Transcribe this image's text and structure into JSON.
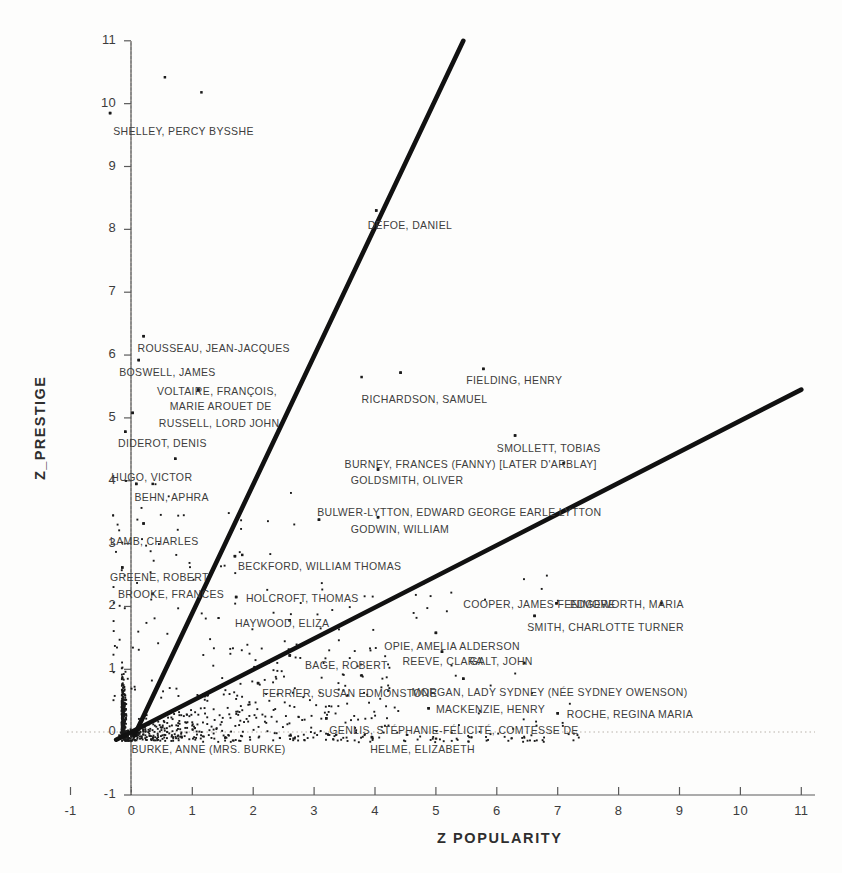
{
  "chart_data": {
    "type": "scatter",
    "title": "",
    "xlabel": "Z  POPULARITY",
    "ylabel": "Z_PRESTIGE",
    "xlim": [
      -1,
      11
    ],
    "ylim": [
      -1,
      11
    ],
    "xticks": [
      "-1",
      "0",
      "1",
      "2",
      "3",
      "4",
      "5",
      "6",
      "7",
      "8",
      "9",
      "10",
      "11"
    ],
    "yticks": [
      "-1",
      "0",
      "1",
      "2",
      "3",
      "4",
      "5",
      "6",
      "7",
      "8",
      "9",
      "10",
      "11"
    ],
    "grid": false,
    "reference_lines": [
      {
        "name": "zero-vertical",
        "orientation": "vertical",
        "value": 0,
        "style": "dotted"
      },
      {
        "name": "zero-horizontal",
        "orientation": "horizontal",
        "value": 0,
        "style": "dotted"
      }
    ],
    "trend_lines": [
      {
        "name": "steep-regression-line",
        "x0": 0.05,
        "y0": -0.05,
        "x1": 5.45,
        "y1": 11.0,
        "style": "solid-thick"
      },
      {
        "name": "shallow-regression-line",
        "x0": -0.25,
        "y0": -0.12,
        "x1": 11.0,
        "y1": 5.45,
        "style": "solid-thick"
      }
    ],
    "legend": null,
    "annotations": [
      {
        "label": "SHELLEY, PERCY BYSSHE",
        "x": -0.3,
        "y": 9.55,
        "point_x": -0.35,
        "point_y": 9.85
      },
      {
        "label": "ROUSSEAU, JEAN-JACQUES",
        "x": 0.1,
        "y": 6.1,
        "point_x": 0.2,
        "point_y": 6.3
      },
      {
        "label": "BOSWELL, JAMES",
        "x": -0.2,
        "y": 5.72,
        "point_x": 0.12,
        "point_y": 5.92
      },
      {
        "label": "VOLTAIRE, FRANÇOIS,",
        "x": 0.42,
        "y": 5.42,
        "point_x": 1.1,
        "point_y": 5.45
      },
      {
        "label": "MARIE AROUET DE",
        "x": 0.63,
        "y": 5.17,
        "point_x": null,
        "point_y": null
      },
      {
        "label": "RUSSELL, LORD JOHN",
        "x": 0.45,
        "y": 4.9,
        "point_x": 0.02,
        "point_y": 5.08
      },
      {
        "label": "DIDEROT, DENIS",
        "x": -0.22,
        "y": 4.58,
        "point_x": -0.1,
        "point_y": 4.78
      },
      {
        "label": "HUGO, VICTOR",
        "x": -0.33,
        "y": 4.05,
        "point_x": 0.72,
        "point_y": 4.35
      },
      {
        "label": "BEHN, APHRA",
        "x": 0.05,
        "y": 3.72,
        "point_x": 0.08,
        "point_y": 3.95
      },
      {
        "label": "LAMB, CHARLES",
        "x": -0.35,
        "y": 3.02,
        "point_x": 0.2,
        "point_y": 3.32
      },
      {
        "label": "GREENE, ROBERT",
        "x": -0.35,
        "y": 2.45,
        "point_x": -0.15,
        "point_y": 2.62
      },
      {
        "label": "BROOKE, FRANCES",
        "x": -0.22,
        "y": 2.18,
        "point_x": 0.35,
        "point_y": 2.2
      },
      {
        "label": "DEFOE, DANIEL",
        "x": 3.88,
        "y": 8.05,
        "point_x": 4.02,
        "point_y": 8.3
      },
      {
        "label": "FIELDING, HENRY",
        "x": 5.5,
        "y": 5.58,
        "point_x": 5.78,
        "point_y": 5.78
      },
      {
        "label": "RICHARDSON, SAMUEL",
        "x": 3.78,
        "y": 5.28,
        "point_x": 4.42,
        "point_y": 5.72
      },
      {
        "label": "SMOLLETT, TOBIAS",
        "x": 6.0,
        "y": 4.5,
        "point_x": 6.3,
        "point_y": 4.72
      },
      {
        "label": "BURNEY, FRANCES (FANNY) [LATER D'ARBLAY]",
        "x": 3.5,
        "y": 4.25,
        "point_x": 7.1,
        "point_y": 4.28
      },
      {
        "label": "GOLDSMITH, OLIVER",
        "x": 3.6,
        "y": 4.0,
        "point_x": 4.05,
        "point_y": 4.18
      },
      {
        "label": "BULWER-LYTTON, EDWARD GEORGE EARLE LYTTON",
        "x": 3.05,
        "y": 3.48,
        "point_x": 3.08,
        "point_y": 3.38
      },
      {
        "label": "GODWIN, WILLIAM",
        "x": 3.6,
        "y": 3.22,
        "point_x": 4.05,
        "point_y": 3.42
      },
      {
        "label": "BECKFORD, WILLIAM THOMAS",
        "x": 1.75,
        "y": 2.62,
        "point_x": 1.7,
        "point_y": 2.8
      },
      {
        "label": "HOLCROFT, THOMAS",
        "x": 1.88,
        "y": 2.12,
        "point_x": 1.72,
        "point_y": 2.15
      },
      {
        "label": "HAYWOOD, ELIZA",
        "x": 1.7,
        "y": 1.72,
        "point_x": 2.6,
        "point_y": 1.78
      },
      {
        "label": "COOPER, JAMES FENIMORE",
        "x": 5.45,
        "y": 2.02,
        "point_x": 6.98,
        "point_y": 2.05
      },
      {
        "label": "EDGEWORTH, MARIA",
        "x": 7.2,
        "y": 2.02,
        "point_x": 8.7,
        "point_y": 2.05
      },
      {
        "label": "SMITH, CHARLOTTE TURNER",
        "x": 6.5,
        "y": 1.65,
        "point_x": 6.62,
        "point_y": 1.85
      },
      {
        "label": "OPIE, AMELIA ALDERSON",
        "x": 4.15,
        "y": 1.35,
        "point_x": 5.0,
        "point_y": 1.58
      },
      {
        "label": "REEVE, CLARA",
        "x": 4.45,
        "y": 1.12,
        "point_x": 5.1,
        "point_y": 1.28
      },
      {
        "label": "GALT, JOHN",
        "x": 5.55,
        "y": 1.12,
        "point_x": 6.45,
        "point_y": 1.1
      },
      {
        "label": "BAGE, ROBERT",
        "x": 2.85,
        "y": 1.05,
        "point_x": 2.6,
        "point_y": 1.22
      },
      {
        "label": "MORGAN, LADY SYDNEY (NÉE SYDNEY OWENSON)",
        "x": 4.6,
        "y": 0.62,
        "point_x": 5.45,
        "point_y": 0.85
      },
      {
        "label": "FERRIER, SUSAN EDMONSTONE",
        "x": 2.15,
        "y": 0.6,
        "point_x": 2.08,
        "point_y": 0.78
      },
      {
        "label": "MACKENZIE, HENRY",
        "x": 5.0,
        "y": 0.35,
        "point_x": 4.88,
        "point_y": 0.38
      },
      {
        "label": "ROCHE, REGINA MARIA",
        "x": 7.15,
        "y": 0.28,
        "point_x": 7.0,
        "point_y": 0.3
      },
      {
        "label": "GENLIS, STÉPHANIE-FÉLICITÉ, COMTESSE DE",
        "x": 3.25,
        "y": 0.02,
        "point_x": 3.2,
        "point_y": 0.22
      },
      {
        "label": "BURKE, ANNE (MRS. BURKE)",
        "x": 0.0,
        "y": -0.28,
        "point_x": null,
        "point_y": null
      },
      {
        "label": "HELME, ELIZABETH",
        "x": 3.92,
        "y": -0.28,
        "point_x": 3.95,
        "point_y": -0.08
      }
    ],
    "named_points": [
      {
        "x": -0.35,
        "y": 9.85
      },
      {
        "x": 0.55,
        "y": 10.42
      },
      {
        "x": 1.15,
        "y": 10.18
      },
      {
        "x": 0.2,
        "y": 6.3
      },
      {
        "x": 0.12,
        "y": 5.92
      },
      {
        "x": 1.1,
        "y": 5.45
      },
      {
        "x": 0.02,
        "y": 5.08
      },
      {
        "x": -0.1,
        "y": 4.78
      },
      {
        "x": 0.72,
        "y": 4.35
      },
      {
        "x": 0.08,
        "y": 3.95
      },
      {
        "x": 0.35,
        "y": 3.95
      },
      {
        "x": 0.2,
        "y": 3.32
      },
      {
        "x": -0.15,
        "y": 2.62
      },
      {
        "x": 0.35,
        "y": 2.2
      },
      {
        "x": 4.02,
        "y": 8.3
      },
      {
        "x": 5.78,
        "y": 5.78
      },
      {
        "x": 4.42,
        "y": 5.72
      },
      {
        "x": 3.78,
        "y": 5.65
      },
      {
        "x": 6.3,
        "y": 4.72
      },
      {
        "x": 7.1,
        "y": 4.28
      },
      {
        "x": 4.05,
        "y": 4.18
      },
      {
        "x": 3.08,
        "y": 3.38
      },
      {
        "x": 4.05,
        "y": 3.42
      },
      {
        "x": 1.7,
        "y": 2.8
      },
      {
        "x": 1.82,
        "y": 2.82
      },
      {
        "x": 1.72,
        "y": 2.15
      },
      {
        "x": 2.6,
        "y": 1.78
      },
      {
        "x": 6.98,
        "y": 2.05
      },
      {
        "x": 8.7,
        "y": 2.05
      },
      {
        "x": 6.62,
        "y": 1.85
      },
      {
        "x": 5.0,
        "y": 1.58
      },
      {
        "x": 5.1,
        "y": 1.28
      },
      {
        "x": 6.45,
        "y": 1.1
      },
      {
        "x": 2.6,
        "y": 1.22
      },
      {
        "x": 5.45,
        "y": 0.85
      },
      {
        "x": 2.08,
        "y": 0.78
      },
      {
        "x": 4.88,
        "y": 0.38
      },
      {
        "x": 7.0,
        "y": 0.3
      },
      {
        "x": 3.2,
        "y": 0.22
      },
      {
        "x": 3.95,
        "y": -0.08
      }
    ],
    "n_points_note": "dense cluster of several hundred points concentrated near the origin"
  },
  "figure": {
    "background_color": "#fdfdfc",
    "point_color": "#1a1a1a",
    "line_color": "#111111",
    "axis_color": "#555555",
    "text_color": "#3d3d3d"
  }
}
